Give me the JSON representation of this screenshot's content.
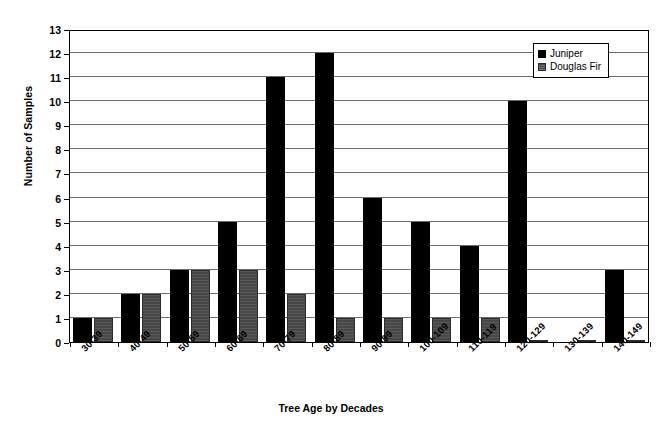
{
  "chart_data": {
    "type": "bar",
    "title": "",
    "xlabel": "Tree Age by Decades",
    "ylabel": "Number of Samples",
    "categories": [
      "30-39",
      "40-49",
      "50-59",
      "60-69",
      "70-79",
      "80-89",
      "90-99",
      "100-109",
      "110-119",
      "120-129",
      "130-139",
      "140-149"
    ],
    "series": [
      {
        "name": "Juniper",
        "color": "#000000",
        "values": [
          1,
          2,
          3,
          5,
          11,
          12,
          6,
          5,
          4,
          10,
          0,
          3
        ]
      },
      {
        "name": "Douglas Fir",
        "color": "#474747",
        "values": [
          1,
          2,
          3,
          3,
          2,
          1,
          1,
          1,
          1,
          0,
          0,
          0
        ]
      }
    ],
    "ylim": [
      0,
      13
    ],
    "ytick_labels": [
      "0",
      "1",
      "2",
      "3",
      "4",
      "5",
      "6",
      "7",
      "8",
      "9",
      "10",
      "11",
      "12",
      "13"
    ],
    "grid": true,
    "legend_position": "top-right"
  },
  "legend": {
    "items": [
      {
        "label": "Juniper"
      },
      {
        "label": "Douglas Fir"
      }
    ]
  }
}
